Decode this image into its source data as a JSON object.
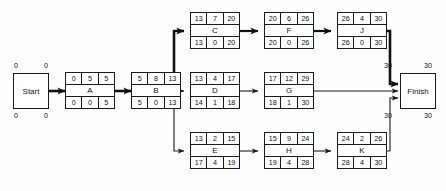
{
  "diagram": {
    "colors": {
      "stroke": "#1a1a1a",
      "background": "#fdfdfd",
      "critical": "#111111"
    }
  },
  "terminals": [
    {
      "id": "start",
      "label": "Start",
      "corner_top_left": "0",
      "corner_top_right": "0",
      "corner_bottom_left": "0",
      "corner_bottom_right": "0"
    },
    {
      "id": "finish",
      "label": "Finish",
      "corner_top_left": "30",
      "corner_top_right": "30",
      "corner_bottom_left": "30",
      "corner_bottom_right": "30"
    }
  ],
  "nodes": [
    {
      "id": "A",
      "label": "A",
      "top": [
        "0",
        "5",
        "5"
      ],
      "bottom": [
        "0",
        "0",
        "5"
      ]
    },
    {
      "id": "B",
      "label": "B",
      "top": [
        "5",
        "8",
        "13"
      ],
      "bottom": [
        "5",
        "0",
        "13"
      ]
    },
    {
      "id": "C",
      "label": "C",
      "top": [
        "13",
        "7",
        "20"
      ],
      "bottom": [
        "13",
        "0",
        "20"
      ]
    },
    {
      "id": "D",
      "label": "D",
      "top": [
        "13",
        "4",
        "17"
      ],
      "bottom": [
        "14",
        "1",
        "18"
      ]
    },
    {
      "id": "E",
      "label": "E",
      "top": [
        "13",
        "2",
        "15"
      ],
      "bottom": [
        "17",
        "4",
        "19"
      ]
    },
    {
      "id": "F",
      "label": "F",
      "top": [
        "20",
        "6",
        "26"
      ],
      "bottom": [
        "20",
        "0",
        "26"
      ]
    },
    {
      "id": "G",
      "label": "G",
      "top": [
        "17",
        "12",
        "29"
      ],
      "bottom": [
        "18",
        "1",
        "30"
      ]
    },
    {
      "id": "H",
      "label": "H",
      "top": [
        "15",
        "9",
        "24"
      ],
      "bottom": [
        "19",
        "4",
        "28"
      ]
    },
    {
      "id": "J",
      "label": "J",
      "top": [
        "26",
        "4",
        "30"
      ],
      "bottom": [
        "26",
        "0",
        "30"
      ]
    },
    {
      "id": "K",
      "label": "K",
      "top": [
        "24",
        "2",
        "26"
      ],
      "bottom": [
        "28",
        "4",
        "30"
      ]
    }
  ],
  "edges": [
    {
      "from": "start",
      "to": "A",
      "critical": true
    },
    {
      "from": "A",
      "to": "B",
      "critical": true
    },
    {
      "from": "B",
      "to": "C",
      "critical": true
    },
    {
      "from": "B",
      "to": "D",
      "critical": false
    },
    {
      "from": "B",
      "to": "E",
      "critical": false
    },
    {
      "from": "C",
      "to": "F",
      "critical": true
    },
    {
      "from": "F",
      "to": "J",
      "critical": true
    },
    {
      "from": "D",
      "to": "G",
      "critical": false
    },
    {
      "from": "E",
      "to": "H",
      "critical": false
    },
    {
      "from": "H",
      "to": "K",
      "critical": false
    },
    {
      "from": "J",
      "to": "finish",
      "critical": true
    },
    {
      "from": "G",
      "to": "finish",
      "critical": false
    },
    {
      "from": "K",
      "to": "finish",
      "critical": false
    }
  ]
}
